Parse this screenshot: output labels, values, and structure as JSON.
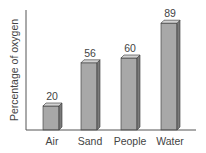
{
  "chart_data": {
    "type": "bar",
    "title": "",
    "xlabel": "",
    "ylabel": "Percentage of oxygen",
    "categories": [
      "Air",
      "Sand",
      "People",
      "Water"
    ],
    "values": [
      20,
      56,
      60,
      89
    ],
    "ylim": [
      0,
      100
    ],
    "grid": false,
    "legend": null,
    "data_labels": true,
    "style": "3d-bars"
  },
  "colors": {
    "bar_front": "#a8a8a8",
    "bar_side": "#7a7a7a",
    "bar_top": "#d2d2d2",
    "axis": "#555555",
    "text": "#444444"
  }
}
